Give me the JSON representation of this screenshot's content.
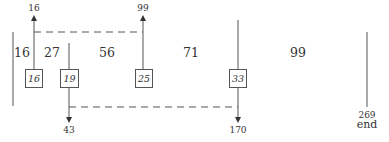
{
  "diagram": {
    "type": "segment-interval-diagram",
    "segments": [
      {
        "label": "16",
        "x": 22
      },
      {
        "label": "27",
        "x": 52
      },
      {
        "label": "56",
        "x": 107
      },
      {
        "label": "71",
        "x": 191
      },
      {
        "label": "99",
        "x": 298
      }
    ],
    "boxes": [
      {
        "label": "16",
        "x": 34,
        "direction": "up",
        "end_label": "16"
      },
      {
        "label": "19",
        "x": 69,
        "direction": "down",
        "end_label": "43"
      },
      {
        "label": "25",
        "x": 143,
        "direction": "up",
        "end_label": "99"
      },
      {
        "label": "33",
        "x": 238,
        "direction": "down",
        "end_label": "170"
      }
    ],
    "connections": [
      {
        "from_box": "16",
        "to_box": "25",
        "style": "dashed",
        "position": "top"
      },
      {
        "from_box": "19",
        "to_box": "33",
        "style": "dashed",
        "position": "bottom"
      }
    ],
    "end_marker": {
      "value": "269",
      "label": "end"
    }
  }
}
